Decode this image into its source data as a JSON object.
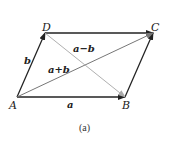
{
  "diagram": {
    "points": {
      "A": {
        "label": "A",
        "x": 17,
        "y": 97
      },
      "B": {
        "label": "B",
        "x": 125,
        "y": 97
      },
      "C": {
        "label": "C",
        "x": 153,
        "y": 33
      },
      "D": {
        "label": "D",
        "x": 45,
        "y": 33
      }
    },
    "vectors": {
      "a": "a",
      "b": "b",
      "sum": "a+b",
      "diff": "a−b"
    },
    "caption": "(a)",
    "colors": {
      "edge": "#222222",
      "sum_diagonal": "#777777",
      "diff_diagonal": "#b0b0b0"
    }
  }
}
